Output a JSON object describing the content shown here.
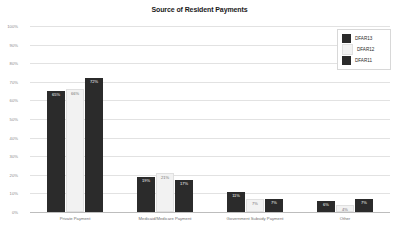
{
  "chart_data": {
    "type": "bar",
    "title": "Source of Resident Payments",
    "xlabel": "",
    "ylabel": "",
    "ylim": [
      0,
      100
    ],
    "ytick_labels": [
      "100%",
      "90%",
      "80%",
      "70%",
      "60%",
      "50%",
      "40%",
      "30%",
      "20%",
      "10%",
      "0%"
    ],
    "ytick_values": [
      100,
      90,
      80,
      70,
      60,
      50,
      40,
      30,
      20,
      10,
      0
    ],
    "grid": true,
    "legend_position": "top-right",
    "value_suffix": "%",
    "categories": [
      "Private Payment",
      "Medicaid/Medicare Payment",
      "Government Subsidy Payment",
      "Other"
    ],
    "series": [
      {
        "name": "DFAR13",
        "color": "#2b2b2b",
        "values": [
          65,
          19,
          11,
          6
        ],
        "labels": [
          "65%",
          "19%",
          "11%",
          "6%"
        ]
      },
      {
        "name": "DFAR12",
        "color": "#f2f2f2",
        "values": [
          66,
          21,
          7,
          4
        ],
        "labels": [
          "66%",
          "21%",
          "7%",
          "4%"
        ]
      },
      {
        "name": "DFAR11",
        "color": "#2b2b2b",
        "values": [
          72,
          17,
          7,
          7
        ],
        "labels": [
          "72%",
          "17%",
          "7%",
          "7%"
        ]
      }
    ]
  }
}
